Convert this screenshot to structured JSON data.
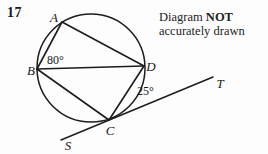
{
  "colors": {
    "ink": "#1c1c1c",
    "background": "#fdfdfd"
  },
  "question": {
    "number": "17"
  },
  "note": {
    "line1_regular": "Diagram ",
    "line1_bold": "NOT",
    "line2": "accurately drawn"
  },
  "diagram": {
    "point_labels": {
      "A": "A",
      "B": "B",
      "C": "C",
      "D": "D",
      "S": "S",
      "T": "T"
    },
    "angle_labels": {
      "angle_ABD": "80°",
      "angle_DCT": "25°"
    }
  }
}
